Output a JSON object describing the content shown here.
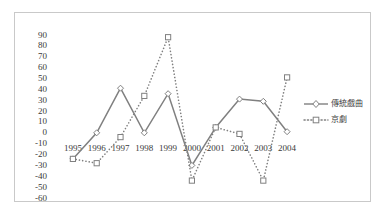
{
  "chart_data": {
    "type": "line",
    "title": "",
    "xlabel": "",
    "ylabel": "",
    "categories": [
      "1995",
      "1996",
      "1997",
      "1998",
      "1999",
      "2000",
      "2001",
      "2002",
      "2003",
      "2004"
    ],
    "ylim": [
      -60,
      90
    ],
    "ytick_step": 10,
    "yticks": [
      90,
      80,
      70,
      60,
      50,
      40,
      30,
      20,
      10,
      0,
      -10,
      -20,
      -30,
      -40,
      -50,
      -60
    ],
    "grid": false,
    "legend_position": "right",
    "series": [
      {
        "name": "傳統戲曲",
        "style": "solid",
        "marker": "diamond",
        "color": "#808080",
        "values": [
          -24,
          0,
          41,
          0,
          36,
          -30,
          5,
          31,
          29,
          1
        ]
      },
      {
        "name": "京劇",
        "style": "dotted",
        "marker": "square",
        "color": "#808080",
        "values": [
          -24,
          -28,
          -4,
          34,
          88,
          -44,
          5,
          -1,
          -44,
          51
        ]
      }
    ]
  },
  "colors": {
    "frame_border": "#c9c9c9",
    "background": "#ffffff",
    "text": "#3a3a3a",
    "series_1": "#808080",
    "series_2": "#808080"
  },
  "legend": {
    "items": [
      {
        "label": "傳統戲曲"
      },
      {
        "label": "京劇"
      }
    ]
  }
}
